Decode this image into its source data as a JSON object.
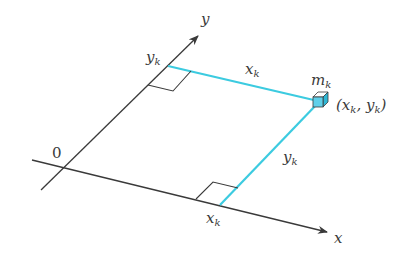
{
  "diagram": {
    "axes": {
      "x_label": "x",
      "y_label": "y",
      "origin_label": "0"
    },
    "point": {
      "mass_label_main": "m",
      "mass_label_sub": "k",
      "coord_open": "(x",
      "coord_sub1": "k",
      "coord_mid": ", y",
      "coord_sub2": "k",
      "coord_close": ")"
    },
    "segments": {
      "horizontal_label_main": "x",
      "horizontal_label_sub": "k",
      "vertical_label_main": "y",
      "vertical_label_sub": "k"
    },
    "axis_ticks": {
      "y_tick_main": "y",
      "y_tick_sub": "k",
      "x_tick_main": "x",
      "x_tick_sub": "k"
    },
    "colors": {
      "axis": "#3a3a3a",
      "projection": "#3ccbe0",
      "cube_fill": "#5fd0ea",
      "cube_top": "#ffffff"
    }
  }
}
